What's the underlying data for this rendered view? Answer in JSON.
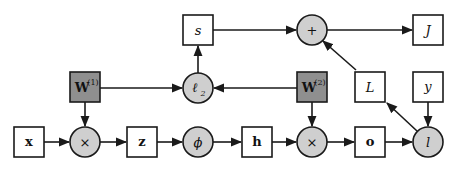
{
  "colors": {
    "stroke": "#1a1a1a",
    "box_fill": "#ffffff",
    "operator_fill": "#cfcfcf",
    "parameter_fill": "#8f8f8f",
    "background": "#ffffff"
  },
  "nodes": {
    "x": {
      "label": "x",
      "kind": "variable"
    },
    "mul1": {
      "label": "×",
      "kind": "operator"
    },
    "z": {
      "label": "z",
      "kind": "variable"
    },
    "phi": {
      "label": "ϕ",
      "kind": "operator"
    },
    "h": {
      "label": "h",
      "kind": "variable"
    },
    "mul2": {
      "label": "×",
      "kind": "operator"
    },
    "o": {
      "label": "o",
      "kind": "variable"
    },
    "l": {
      "label": "l",
      "kind": "operator"
    },
    "W1": {
      "label": "W",
      "sup": "(1)",
      "kind": "parameter"
    },
    "l2": {
      "label": "ℓ",
      "sub": "2",
      "kind": "operator"
    },
    "W2": {
      "label": "W",
      "sup": "(2)",
      "kind": "parameter"
    },
    "L": {
      "label": "L",
      "kind": "variable"
    },
    "y": {
      "label": "y",
      "kind": "variable"
    },
    "s": {
      "label": "s",
      "kind": "variable"
    },
    "plus": {
      "label": "+",
      "kind": "operator"
    },
    "J": {
      "label": "J",
      "kind": "variable"
    }
  },
  "edges": [
    [
      "x",
      "mul1"
    ],
    [
      "W1",
      "mul1"
    ],
    [
      "mul1",
      "z"
    ],
    [
      "z",
      "phi"
    ],
    [
      "phi",
      "h"
    ],
    [
      "h",
      "mul2"
    ],
    [
      "W2",
      "mul2"
    ],
    [
      "mul2",
      "o"
    ],
    [
      "o",
      "l"
    ],
    [
      "y",
      "l"
    ],
    [
      "l",
      "L"
    ],
    [
      "L",
      "plus"
    ],
    [
      "W1",
      "l2"
    ],
    [
      "W2",
      "l2"
    ],
    [
      "l2",
      "s"
    ],
    [
      "s",
      "plus"
    ],
    [
      "plus",
      "J"
    ]
  ]
}
